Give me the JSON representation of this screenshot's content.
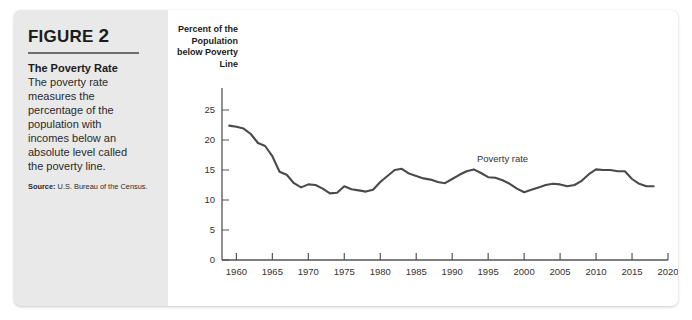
{
  "figure": {
    "label": "FIGURE",
    "number": "2",
    "caption_heading": "The Poverty Rate",
    "caption_body": "The poverty rate measures the percentage of the population with incomes below an absolute level called the poverty line.",
    "source_label": "Source:",
    "source_text": "U.S. Bureau of the Census."
  },
  "colors": {
    "panel_background": "#e9e9e9",
    "plot_background": "#ffffff",
    "line": "#4a4a4a",
    "axis": "#555555",
    "text": "#1b1b1b",
    "rule": "#6e6e6e"
  },
  "chart_data": {
    "type": "line",
    "title": "",
    "subtitle": "",
    "xlabel": "",
    "ylabel": "Percent of the Population below Poverty Line",
    "ylabel_lines": [
      "Percent of the",
      "Population",
      "below Poverty",
      "Line"
    ],
    "xlim": [
      1958,
      2020
    ],
    "ylim": [
      0,
      27
    ],
    "xticks": [
      1960,
      1965,
      1970,
      1975,
      1980,
      1985,
      1990,
      1995,
      2000,
      2005,
      2010,
      2015,
      2020
    ],
    "xtick_labels": [
      "1960",
      "1965",
      "1970",
      "1975",
      "1980",
      "1985",
      "1990",
      "1995",
      "2000",
      "2005",
      "2010",
      "2015",
      "2020"
    ],
    "yticks": [
      0,
      5,
      10,
      15,
      20,
      25
    ],
    "ytick_labels": [
      "0",
      "5",
      "10",
      "15",
      "20",
      "25"
    ],
    "grid": false,
    "legend_position": "inline-annotation",
    "series": [
      {
        "name": "Poverty rate",
        "annotation": "Poverty rate",
        "annotation_x": 1997,
        "annotation_y": 16.4,
        "x": [
          1959,
          1960,
          1961,
          1962,
          1963,
          1964,
          1965,
          1966,
          1967,
          1968,
          1969,
          1970,
          1971,
          1972,
          1973,
          1974,
          1975,
          1976,
          1977,
          1978,
          1979,
          1980,
          1981,
          1982,
          1983,
          1984,
          1985,
          1986,
          1987,
          1988,
          1989,
          1990,
          1991,
          1992,
          1993,
          1994,
          1995,
          1996,
          1997,
          1998,
          1999,
          2000,
          2001,
          2002,
          2003,
          2004,
          2005,
          2006,
          2007,
          2008,
          2009,
          2010,
          2011,
          2012,
          2013,
          2014,
          2015,
          2016,
          2017,
          2018
        ],
        "values": [
          22.4,
          22.2,
          21.9,
          21.0,
          19.5,
          19.0,
          17.3,
          14.7,
          14.2,
          12.8,
          12.1,
          12.6,
          12.5,
          11.9,
          11.1,
          11.2,
          12.3,
          11.8,
          11.6,
          11.4,
          11.7,
          13.0,
          14.0,
          15.0,
          15.2,
          14.4,
          14.0,
          13.6,
          13.4,
          13.0,
          12.8,
          13.5,
          14.2,
          14.8,
          15.1,
          14.5,
          13.8,
          13.7,
          13.3,
          12.7,
          11.9,
          11.3,
          11.7,
          12.1,
          12.5,
          12.7,
          12.6,
          12.3,
          12.5,
          13.2,
          14.3,
          15.1,
          15.0,
          15.0,
          14.8,
          14.8,
          13.5,
          12.7,
          12.3,
          12.3
        ]
      }
    ]
  }
}
